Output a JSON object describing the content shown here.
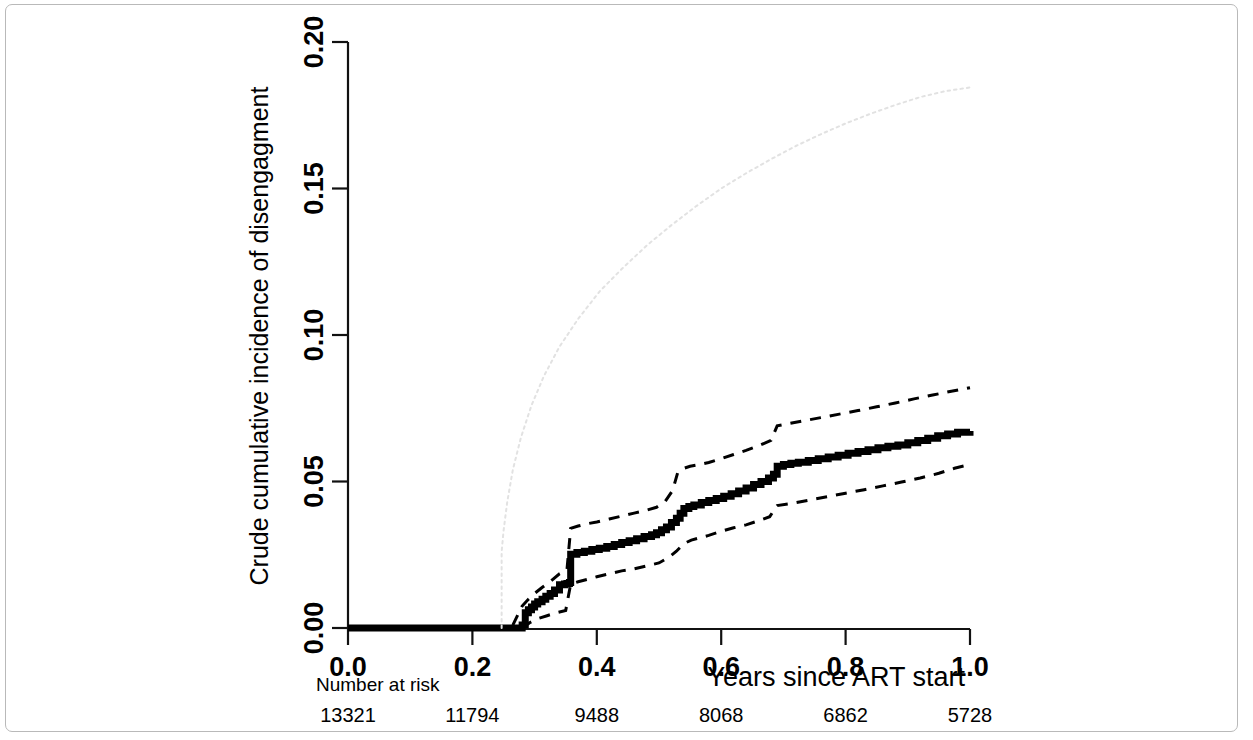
{
  "figure": {
    "border_color": "#b9b9b9",
    "background": "#ffffff"
  },
  "chart_data": {
    "type": "line",
    "title": "",
    "xlabel": "Years since ART start",
    "ylabel": "Crude cumulative incidence of disengagment",
    "xlim": [
      0.0,
      1.0
    ],
    "ylim": [
      0.0,
      0.2
    ],
    "xticks": [
      0.0,
      0.2,
      0.4,
      0.6,
      0.8,
      1.0
    ],
    "xticklabels": [
      "0.0",
      "0.2",
      "0.4",
      "0.6",
      "0.8",
      "1.0"
    ],
    "yticks": [
      0.0,
      0.05,
      0.1,
      0.15,
      0.2
    ],
    "yticklabels": [
      "0.00",
      "0.05",
      "0.10",
      "0.15",
      "0.20"
    ],
    "grid": false,
    "legend": null,
    "series": [
      {
        "name": "crude-cumulative-incidence",
        "style": "step-solid-thick",
        "color": "#000000",
        "width": 7,
        "x": [
          0.0,
          0.24,
          0.275,
          0.28,
          0.285,
          0.29,
          0.295,
          0.3,
          0.305,
          0.312,
          0.318,
          0.325,
          0.332,
          0.34,
          0.348,
          0.352,
          0.356,
          0.358,
          0.368,
          0.38,
          0.392,
          0.404,
          0.416,
          0.428,
          0.44,
          0.452,
          0.464,
          0.476,
          0.488,
          0.496,
          0.504,
          0.512,
          0.52,
          0.528,
          0.534,
          0.54,
          0.548,
          0.556,
          0.568,
          0.58,
          0.592,
          0.604,
          0.616,
          0.628,
          0.64,
          0.652,
          0.664,
          0.676,
          0.684,
          0.69,
          0.7,
          0.712,
          0.724,
          0.74,
          0.756,
          0.772,
          0.788,
          0.804,
          0.82,
          0.836,
          0.852,
          0.868,
          0.884,
          0.9,
          0.916,
          0.932,
          0.948,
          0.964,
          0.98,
          1.0
        ],
        "y": [
          0.0,
          0.0,
          0.0,
          0.001,
          0.0052,
          0.0062,
          0.0072,
          0.0082,
          0.009,
          0.0098,
          0.0108,
          0.0118,
          0.013,
          0.0148,
          0.015,
          0.0152,
          0.0155,
          0.0252,
          0.0258,
          0.0262,
          0.0268,
          0.0272,
          0.0278,
          0.0285,
          0.0292,
          0.0298,
          0.0305,
          0.0312,
          0.0318,
          0.0325,
          0.0335,
          0.0345,
          0.036,
          0.0375,
          0.0392,
          0.0408,
          0.0415,
          0.042,
          0.0428,
          0.0435,
          0.0442,
          0.045,
          0.0458,
          0.0468,
          0.0478,
          0.049,
          0.05,
          0.0512,
          0.0525,
          0.0552,
          0.0558,
          0.0562,
          0.0566,
          0.0572,
          0.0578,
          0.0584,
          0.059,
          0.0596,
          0.0602,
          0.0608,
          0.0615,
          0.062,
          0.0625,
          0.0632,
          0.064,
          0.0648,
          0.0656,
          0.0662,
          0.0668,
          0.0672
        ]
      },
      {
        "name": "upper-confidence-band",
        "style": "dashed",
        "color": "#000000",
        "width": 3,
        "x": [
          0.265,
          0.28,
          0.29,
          0.3,
          0.312,
          0.325,
          0.34,
          0.352,
          0.358,
          0.37,
          0.385,
          0.4,
          0.42,
          0.44,
          0.46,
          0.48,
          0.496,
          0.51,
          0.522,
          0.53,
          0.54,
          0.55,
          0.565,
          0.58,
          0.6,
          0.62,
          0.64,
          0.66,
          0.68,
          0.69,
          0.71,
          0.73,
          0.76,
          0.79,
          0.82,
          0.85,
          0.88,
          0.91,
          0.94,
          0.97,
          1.0
        ],
        "y": [
          0.001,
          0.0075,
          0.0098,
          0.0118,
          0.0138,
          0.0158,
          0.0185,
          0.0198,
          0.034,
          0.0348,
          0.0356,
          0.0362,
          0.0372,
          0.0382,
          0.0392,
          0.0402,
          0.0412,
          0.0432,
          0.047,
          0.053,
          0.0545,
          0.0552,
          0.0558,
          0.0565,
          0.0578,
          0.0592,
          0.0606,
          0.0622,
          0.064,
          0.069,
          0.0698,
          0.0706,
          0.0718,
          0.073,
          0.0742,
          0.0755,
          0.0768,
          0.0782,
          0.0795,
          0.0808,
          0.082
        ]
      },
      {
        "name": "lower-confidence-band",
        "style": "dashed",
        "color": "#000000",
        "width": 3,
        "x": [
          0.28,
          0.292,
          0.305,
          0.32,
          0.335,
          0.35,
          0.358,
          0.37,
          0.385,
          0.4,
          0.42,
          0.44,
          0.46,
          0.48,
          0.5,
          0.515,
          0.528,
          0.54,
          0.552,
          0.566,
          0.58,
          0.6,
          0.62,
          0.64,
          0.66,
          0.678,
          0.69,
          0.71,
          0.74,
          0.77,
          0.8,
          0.83,
          0.86,
          0.89,
          0.92,
          0.95,
          0.975,
          1.0
        ],
        "y": [
          0.0,
          0.0018,
          0.0032,
          0.0042,
          0.0052,
          0.006,
          0.015,
          0.0158,
          0.0166,
          0.0175,
          0.0185,
          0.0195,
          0.0202,
          0.0212,
          0.0222,
          0.024,
          0.0262,
          0.0288,
          0.03,
          0.0308,
          0.0316,
          0.033,
          0.0342,
          0.0352,
          0.0366,
          0.038,
          0.0418,
          0.0424,
          0.0436,
          0.0448,
          0.046,
          0.0472,
          0.0485,
          0.0498,
          0.0512,
          0.0528,
          0.0545,
          0.0558
        ]
      },
      {
        "name": "reference-dotted-curve",
        "style": "dotted",
        "color": "#e2e2e2",
        "width": 2,
        "x": [
          0.247,
          0.247,
          0.25,
          0.256,
          0.265,
          0.278,
          0.295,
          0.315,
          0.34,
          0.37,
          0.405,
          0.44,
          0.48,
          0.52,
          0.56,
          0.6,
          0.64,
          0.68,
          0.72,
          0.76,
          0.8,
          0.84,
          0.88,
          0.92,
          0.96,
          1.0
        ],
        "y": [
          0.0,
          0.026,
          0.033,
          0.043,
          0.054,
          0.065,
          0.076,
          0.086,
          0.096,
          0.1055,
          0.115,
          0.1225,
          0.1305,
          0.1375,
          0.144,
          0.15,
          0.1552,
          0.16,
          0.1645,
          0.1685,
          0.1722,
          0.1755,
          0.1785,
          0.1812,
          0.1832,
          0.1845
        ]
      }
    ],
    "risk_table": {
      "label": "Number at risk",
      "times": [
        0.0,
        0.2,
        0.4,
        0.6,
        0.8,
        1.0
      ],
      "counts": [
        "13321",
        "11794",
        "9488",
        "8068",
        "6862",
        "5728"
      ]
    }
  }
}
